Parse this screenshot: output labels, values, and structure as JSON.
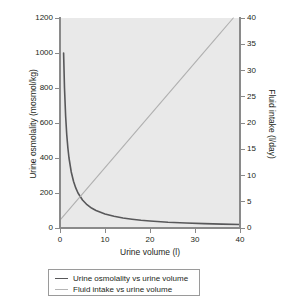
{
  "chart_data": {
    "type": "line",
    "title": "",
    "xlabel": "Urine volume (l)",
    "ylabel": "Urine osmolality (mosmol/kg)",
    "y2label": "Fluid intake (l/day)",
    "xlim": [
      0,
      40
    ],
    "ylim": [
      0,
      1200
    ],
    "y2lim": [
      0,
      40
    ],
    "xticks": [
      0,
      10,
      20,
      30,
      40
    ],
    "yticks": [
      0,
      200,
      400,
      600,
      800,
      1000,
      1200
    ],
    "y2ticks": [
      0,
      5,
      10,
      15,
      20,
      25,
      30,
      35,
      40
    ],
    "grid": false,
    "legend_position": "below-center",
    "plot_background": "#e9e9e9",
    "series": [
      {
        "name": "Urine osmolality vs urine volume",
        "axis": "left",
        "color": "#58585a",
        "relation": "y = 800 / x",
        "x": [
          0.65,
          0.8,
          1,
          1.25,
          1.5,
          1.75,
          2,
          2.5,
          3,
          3.5,
          4,
          5,
          6,
          7,
          8,
          10,
          12,
          14,
          16,
          18,
          20,
          24,
          28,
          32,
          36,
          40
        ],
        "y": [
          1231,
          1000,
          800,
          640,
          533,
          457,
          400,
          320,
          267,
          229,
          200,
          160,
          133,
          114,
          100,
          80,
          67,
          57,
          50,
          44,
          40,
          33,
          29,
          25,
          22,
          20
        ]
      },
      {
        "name": "Fluid intake vs urine volume",
        "axis": "right",
        "color": "#b0b0b0",
        "relation": "intake = volume + 1.5",
        "x": [
          0,
          5,
          10,
          15,
          20,
          25,
          30,
          35,
          38.5
        ],
        "y": [
          1.5,
          6.5,
          11.5,
          16.5,
          21.5,
          26.5,
          31.5,
          36.5,
          40
        ]
      }
    ]
  },
  "legend": {
    "items": [
      {
        "label": "Urine osmolality vs urine volume",
        "color": "#58585a"
      },
      {
        "label": "Fluid intake vs urine volume",
        "color": "#b5b5b5"
      }
    ]
  }
}
